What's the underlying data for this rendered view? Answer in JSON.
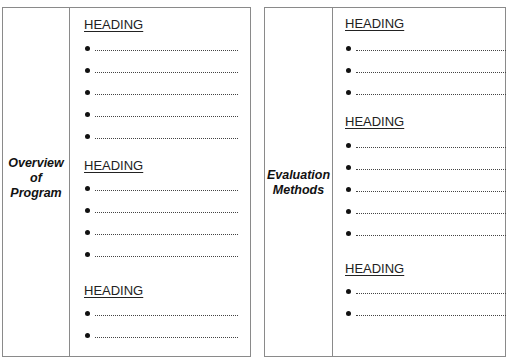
{
  "panels": [
    {
      "label_lines": [
        "Overview",
        "of",
        "Program"
      ],
      "sections": [
        {
          "heading": "HEADING",
          "bullet_count": 5
        },
        {
          "heading": "HEADING",
          "bullet_count": 4
        },
        {
          "heading": "HEADING",
          "bullet_count": 2
        }
      ]
    },
    {
      "label_lines": [
        "Evaluation",
        "Methods"
      ],
      "sections": [
        {
          "heading": "HEADING",
          "bullet_count": 3
        },
        {
          "heading": "HEADING",
          "bullet_count": 5
        },
        {
          "heading": "HEADING",
          "bullet_count": 2
        }
      ]
    }
  ],
  "colors": {
    "border": "#8a8a8a",
    "text": "#111111",
    "background": "#ffffff"
  }
}
